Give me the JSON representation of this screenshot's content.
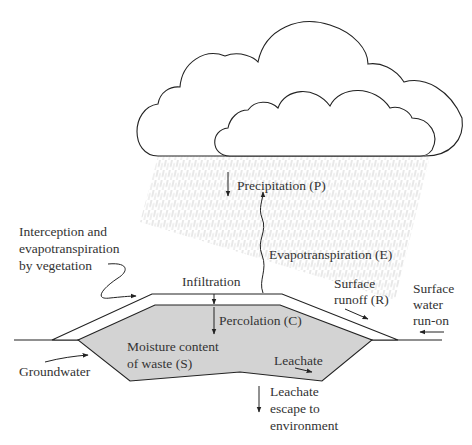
{
  "diagram": {
    "labels": {
      "precipitation": "Precipitation (P)",
      "interception": [
        "Interception and",
        "evapotranspiration",
        "by vegetation"
      ],
      "evapotranspiration": "Evapotranspiration (E)",
      "infiltration": "Infiltration",
      "surface_runoff": [
        "Surface",
        "runoff (R)"
      ],
      "surface_runon": [
        "Surface",
        "water",
        "run-on"
      ],
      "percolation": "Percolation (C)",
      "moisture": [
        "Moisture content",
        "of waste (S)"
      ],
      "leachate": "Leachate",
      "groundwater": "Groundwater",
      "leachate_escape": [
        "Leachate",
        "escape to",
        "environment"
      ]
    },
    "colors": {
      "line": "#222222",
      "waste_fill": "#d3d3d3",
      "rain": "#bdbdbd",
      "text": "#333333"
    }
  }
}
